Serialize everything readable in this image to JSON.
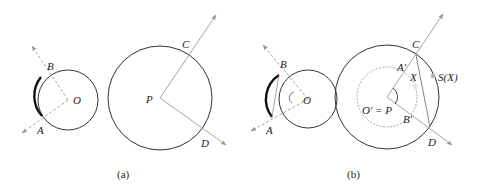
{
  "figure": {
    "panels": [
      {
        "caption": "(a)",
        "labels": {
          "A": "A",
          "B": "B",
          "O": "O",
          "P": "P",
          "C": "C",
          "D": "D"
        }
      },
      {
        "caption": "(b)",
        "labels": {
          "A": "A",
          "B": "B",
          "O": "O",
          "C": "C",
          "D": "D",
          "A_prime": "A'",
          "B_prime": "B'",
          "X": "X",
          "S_of_X": "S(X)",
          "O_prime_eq_P": "O' = P"
        }
      }
    ],
    "colors": {
      "stroke": "#333333",
      "dashed": "#9a9a9a",
      "point": "#b0b0b0"
    }
  }
}
